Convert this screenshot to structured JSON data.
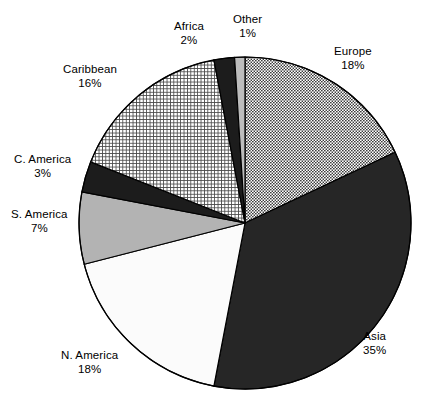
{
  "chart_data": {
    "type": "pie",
    "title": "",
    "subtitle": "",
    "xlabel": "",
    "ylabel": "",
    "legend_position": "none",
    "grid": false,
    "unit": "%",
    "start_angle_deg": 0,
    "direction": "clockwise",
    "categories": [
      "Europe",
      "Asia",
      "N. America",
      "S. America",
      "C. America",
      "Caribbean",
      "Africa",
      "Other"
    ],
    "values": [
      18,
      35,
      18,
      7,
      3,
      16,
      2,
      1
    ],
    "slices": [
      {
        "label": "Europe",
        "value": 18,
        "value_text": "18%",
        "fill_style": "dotted-checker",
        "fill_color": "#8d8d8d",
        "label_x": 334,
        "label_y": 44
      },
      {
        "label": "Asia",
        "value": 35,
        "value_text": "35%",
        "fill_style": "solid",
        "fill_color": "#262626",
        "label_x": 363,
        "label_y": 329
      },
      {
        "label": "N. America",
        "value": 18,
        "value_text": "18%",
        "fill_style": "solid",
        "fill_color": "#fbfbfb",
        "label_x": 61,
        "label_y": 348
      },
      {
        "label": "S. America",
        "value": 7,
        "value_text": "7%",
        "fill_style": "solid",
        "fill_color": "#b3b3b3",
        "label_x": 11,
        "label_y": 207
      },
      {
        "label": "C. America",
        "value": 3,
        "value_text": "3%",
        "fill_style": "solid",
        "fill_color": "#1c1c1c",
        "label_x": 14,
        "label_y": 152
      },
      {
        "label": "Caribbean",
        "value": 16,
        "value_text": "16%",
        "fill_style": "crosshatch-grid",
        "fill_color": "#cfcfcf",
        "label_x": 63,
        "label_y": 62
      },
      {
        "label": "Africa",
        "value": 2,
        "value_text": "2%",
        "fill_style": "solid",
        "fill_color": "#1c1c1c",
        "label_x": 174,
        "label_y": 19
      },
      {
        "label": "Other",
        "value": 1,
        "value_text": "1%",
        "fill_style": "solid",
        "fill_color": "#bdbdbd",
        "label_x": 233,
        "label_y": 12
      }
    ],
    "geometry": {
      "center_x": 245,
      "center_y": 223,
      "radius": 166,
      "stroke_color": "#000000",
      "stroke_width": 1.2
    },
    "background_color": "#ffffff",
    "text_color": "#000000"
  }
}
